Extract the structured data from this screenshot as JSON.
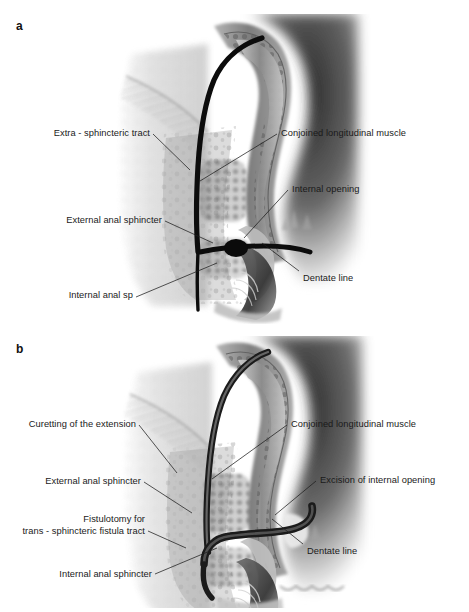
{
  "figure": {
    "type": "medical-illustration",
    "panels": [
      {
        "id": "a",
        "letter": "a",
        "labels_left": [
          {
            "name": "extra-sphincteric-tract",
            "text": "Extra - sphincteric tract"
          },
          {
            "name": "external-anal-sphincter",
            "text": "External anal sphincter"
          },
          {
            "name": "internal-anal-sphincter",
            "text": "Internal anal sp"
          }
        ],
        "labels_right": [
          {
            "name": "conjoined-longitudinal-muscle",
            "text": "Conjoined longitudinal muscle"
          },
          {
            "name": "internal-opening",
            "text": "Internal opening"
          },
          {
            "name": "dentate-line",
            "text": "Dentate line"
          }
        ]
      },
      {
        "id": "b",
        "letter": "b",
        "labels_left": [
          {
            "name": "curetting-of-the-extension",
            "text": "Curetting of the extension"
          },
          {
            "name": "external-anal-sphincter",
            "text": "External anal sphincter"
          },
          {
            "name": "fistulotomy-line1",
            "text": "Fistulotomy for"
          },
          {
            "name": "fistulotomy-line2",
            "text": "trans - sphincteric fistula tract"
          },
          {
            "name": "internal-anal-sphincter",
            "text": "Internal anal sphincter"
          }
        ],
        "labels_right": [
          {
            "name": "conjoined-longitudinal-muscle",
            "text": "Conjoined longitudinal muscle"
          },
          {
            "name": "excision-of-internal-opening",
            "text": "Excision of internal opening"
          },
          {
            "name": "dentate-line",
            "text": "Dentate line"
          }
        ]
      }
    ],
    "colors": {
      "background": "#ffffff",
      "text": "#1a1a1a",
      "leader_line": "#1d1d1d",
      "tract_dark": "#111111",
      "tissue_mid": "#8d8d8d",
      "tissue_light": "#d9d9d9",
      "shadow_dark": "#3a3a3a"
    }
  }
}
